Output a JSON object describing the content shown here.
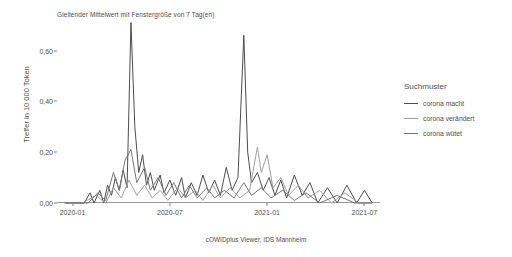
{
  "chart": {
    "title": "Gleitender Mittelwert mit Fenstergröße von 7 Tag(en)",
    "ylabel": "Treffer in 10 000 Token",
    "caption": "cOWIDplus Viewer, IDS Mannheim"
  },
  "legend": {
    "title": "Suchmuster",
    "items": [
      {
        "label": "corona macht",
        "color": "#4d4d4d"
      },
      {
        "label": "corona verändert",
        "color": "#a0a0a0"
      },
      {
        "label": "corona wütet",
        "color": "#777777"
      }
    ]
  },
  "chart_data": {
    "type": "line",
    "title": "Gleitender Mittelwert mit Fenstergröße von 7 Tag(en)",
    "xlabel": "",
    "ylabel": "Treffer in 10 000 Token",
    "xlim": [
      "2019-11-15",
      "2021-08-15"
    ],
    "ylim": [
      0.0,
      0.72
    ],
    "grid": false,
    "legend_position": "right",
    "y_ticks": [
      {
        "value": 0.0,
        "label": "0,00"
      },
      {
        "value": 0.2,
        "label": "0,20"
      },
      {
        "value": 0.4,
        "label": "0,40"
      },
      {
        "value": 0.6,
        "label": "0,60"
      }
    ],
    "x_ticks": [
      {
        "value": "2020-01",
        "label": "2020-01"
      },
      {
        "value": "2020-07",
        "label": "2020-07"
      },
      {
        "value": "2021-01",
        "label": "2021-01"
      },
      {
        "value": "2021-07",
        "label": "2021-07"
      }
    ],
    "x_unit": "month_fraction",
    "series": [
      {
        "name": "corona macht",
        "color": "#4d4d4d",
        "points": [
          [
            2019.96,
            0.0
          ],
          [
            2020.02,
            0.0
          ],
          [
            2020.06,
            0.0
          ],
          [
            2020.09,
            0.04
          ],
          [
            2020.11,
            0.0
          ],
          [
            2020.14,
            0.05
          ],
          [
            2020.16,
            0.0
          ],
          [
            2020.18,
            0.07
          ],
          [
            2020.2,
            0.03
          ],
          [
            2020.22,
            0.1
          ],
          [
            2020.24,
            0.05
          ],
          [
            2020.26,
            0.13
          ],
          [
            2020.28,
            0.06
          ],
          [
            2020.3,
            0.71
          ],
          [
            2020.32,
            0.3
          ],
          [
            2020.34,
            0.12
          ],
          [
            2020.36,
            0.19
          ],
          [
            2020.38,
            0.07
          ],
          [
            2020.4,
            0.12
          ],
          [
            2020.42,
            0.05
          ],
          [
            2020.45,
            0.11
          ],
          [
            2020.47,
            0.04
          ],
          [
            2020.5,
            0.09
          ],
          [
            2020.53,
            0.03
          ],
          [
            2020.56,
            0.1
          ],
          [
            2020.58,
            0.02
          ],
          [
            2020.61,
            0.08
          ],
          [
            2020.64,
            0.03
          ],
          [
            2020.67,
            0.11
          ],
          [
            2020.7,
            0.04
          ],
          [
            2020.73,
            0.09
          ],
          [
            2020.76,
            0.03
          ],
          [
            2020.79,
            0.14
          ],
          [
            2020.82,
            0.05
          ],
          [
            2020.85,
            0.1
          ],
          [
            2020.88,
            0.66
          ],
          [
            2020.9,
            0.2
          ],
          [
            2020.92,
            0.08
          ],
          [
            2020.95,
            0.12
          ],
          [
            2020.98,
            0.05
          ],
          [
            2021.01,
            0.1
          ],
          [
            2021.04,
            0.03
          ],
          [
            2021.07,
            0.09
          ],
          [
            2021.1,
            0.02
          ],
          [
            2021.14,
            0.11
          ],
          [
            2021.18,
            0.03
          ],
          [
            2021.22,
            0.08
          ],
          [
            2021.26,
            0.0
          ],
          [
            2021.31,
            0.06
          ],
          [
            2021.36,
            0.0
          ],
          [
            2021.41,
            0.07
          ],
          [
            2021.46,
            0.0
          ],
          [
            2021.5,
            0.05
          ],
          [
            2021.54,
            0.0
          ]
        ]
      },
      {
        "name": "corona verändert",
        "color": "#a0a0a0",
        "points": [
          [
            2019.96,
            0.0
          ],
          [
            2020.05,
            0.0
          ],
          [
            2020.12,
            0.03
          ],
          [
            2020.17,
            0.0
          ],
          [
            2020.21,
            0.06
          ],
          [
            2020.25,
            0.02
          ],
          [
            2020.29,
            0.09
          ],
          [
            2020.33,
            0.03
          ],
          [
            2020.37,
            0.07
          ],
          [
            2020.41,
            0.02
          ],
          [
            2020.45,
            0.05
          ],
          [
            2020.49,
            0.01
          ],
          [
            2020.54,
            0.06
          ],
          [
            2020.58,
            0.02
          ],
          [
            2020.63,
            0.05
          ],
          [
            2020.67,
            0.01
          ],
          [
            2020.72,
            0.07
          ],
          [
            2020.76,
            0.02
          ],
          [
            2020.81,
            0.06
          ],
          [
            2020.86,
            0.02
          ],
          [
            2020.91,
            0.05
          ],
          [
            2020.95,
            0.22
          ],
          [
            2020.97,
            0.12
          ],
          [
            2021.0,
            0.19
          ],
          [
            2021.03,
            0.06
          ],
          [
            2021.07,
            0.1
          ],
          [
            2021.11,
            0.03
          ],
          [
            2021.16,
            0.07
          ],
          [
            2021.21,
            0.02
          ],
          [
            2021.27,
            0.05
          ],
          [
            2021.33,
            0.0
          ],
          [
            2021.4,
            0.04
          ],
          [
            2021.47,
            0.0
          ],
          [
            2021.54,
            0.0
          ]
        ]
      },
      {
        "name": "corona wütet",
        "color": "#777777",
        "points": [
          [
            2019.96,
            0.0
          ],
          [
            2020.08,
            0.0
          ],
          [
            2020.13,
            0.04
          ],
          [
            2020.17,
            0.01
          ],
          [
            2020.21,
            0.12
          ],
          [
            2020.24,
            0.05
          ],
          [
            2020.27,
            0.17
          ],
          [
            2020.3,
            0.21
          ],
          [
            2020.33,
            0.08
          ],
          [
            2020.37,
            0.14
          ],
          [
            2020.4,
            0.05
          ],
          [
            2020.44,
            0.1
          ],
          [
            2020.48,
            0.03
          ],
          [
            2020.52,
            0.08
          ],
          [
            2020.56,
            0.02
          ],
          [
            2020.6,
            0.07
          ],
          [
            2020.64,
            0.02
          ],
          [
            2020.69,
            0.06
          ],
          [
            2020.73,
            0.02
          ],
          [
            2020.78,
            0.05
          ],
          [
            2020.83,
            0.02
          ],
          [
            2020.88,
            0.08
          ],
          [
            2020.92,
            0.03
          ],
          [
            2020.97,
            0.06
          ],
          [
            2021.02,
            0.02
          ],
          [
            2021.08,
            0.05
          ],
          [
            2021.14,
            0.01
          ],
          [
            2021.2,
            0.04
          ],
          [
            2021.27,
            0.0
          ],
          [
            2021.36,
            0.03
          ],
          [
            2021.45,
            0.0
          ],
          [
            2021.54,
            0.0
          ]
        ]
      }
    ]
  }
}
